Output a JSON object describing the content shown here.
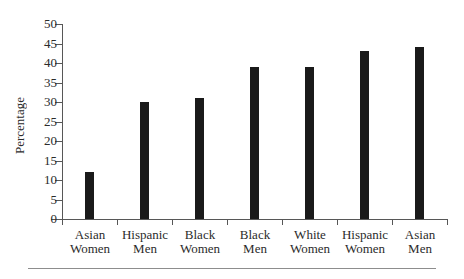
{
  "chart_data": {
    "type": "bar",
    "title": "",
    "subtitle": "",
    "xlabel": "",
    "ylabel": "Percentage",
    "ylim": [
      0,
      50
    ],
    "ytick_step": 5,
    "yticks": [
      0,
      5,
      10,
      15,
      20,
      25,
      30,
      35,
      40,
      45,
      50
    ],
    "ytick_labels": [
      "0",
      "5",
      "10",
      "15",
      "20",
      "25",
      "30",
      "35",
      "40",
      "45",
      "50"
    ],
    "grid": false,
    "legend": false,
    "legend_position": "none",
    "bar_color": "#1a1a1a",
    "axis_color": "#575757",
    "background_color": "#ffffff",
    "categories": [
      "Asian Women",
      "Hispanic Men",
      "Black Women",
      "Black Men",
      "White Women",
      "Hispanic Women",
      "Asian Men"
    ],
    "category_lines": [
      [
        "Asian",
        "Women"
      ],
      [
        "Hispanic",
        "Men"
      ],
      [
        "Black",
        "Women"
      ],
      [
        "Black",
        "Men"
      ],
      [
        "White",
        "Women"
      ],
      [
        "Hispanic",
        "Women"
      ],
      [
        "Asian",
        "Men"
      ]
    ],
    "values": [
      12,
      30,
      31,
      39,
      39,
      43,
      44
    ],
    "value_unit": "percent",
    "annotations": []
  },
  "figure": {
    "bottom_rule_visible": true
  }
}
